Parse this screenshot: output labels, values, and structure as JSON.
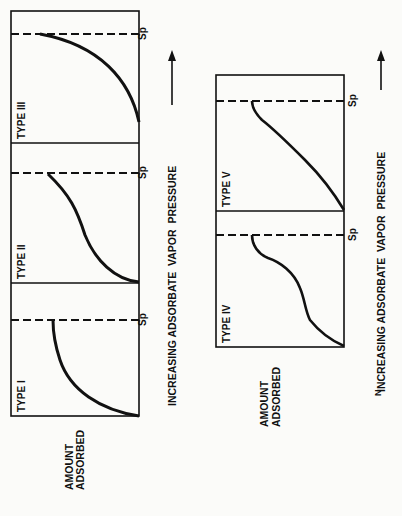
{
  "figure": {
    "orientation": "rotated 90 degrees clockwise",
    "y_axis_label_line1": "AMOUNT",
    "y_axis_label_line2": "ADSORBED",
    "x_axis_label": "INCREASING ADSORBATE  VAPOR  PRESSURE",
    "saturation_label": "Sp",
    "ink_color": "#111111",
    "background_color": "#fbfbf9",
    "caption_fragment": "N"
  },
  "panels_top": [
    {
      "type_label": "TYPE I",
      "curve": "langmuir-plateau"
    },
    {
      "type_label": "TYPE II",
      "curve": "sigmoid-unbounded"
    },
    {
      "type_label": "TYPE III",
      "curve": "convex-rising"
    }
  ],
  "panels_bottom": [
    {
      "type_label": "TYPE IV",
      "curve": "double-step"
    },
    {
      "type_label": "TYPE V",
      "curve": "sigmoid-plateau"
    }
  ]
}
